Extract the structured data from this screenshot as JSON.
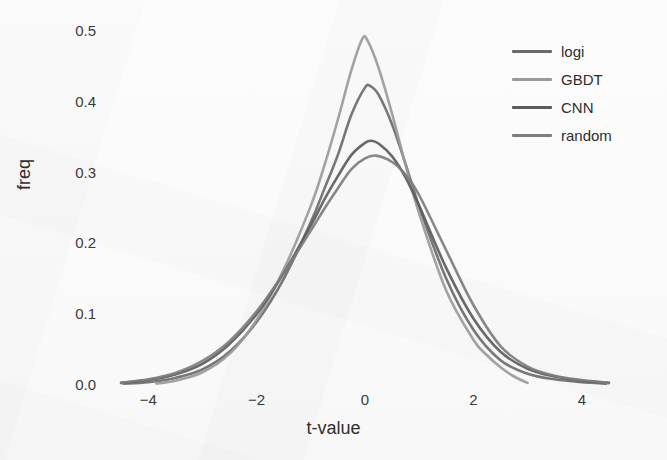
{
  "figure": {
    "background_color": "#fbfbfb",
    "axis_color": "#3a3a3a"
  },
  "chart_data": {
    "type": "line",
    "title": "",
    "subtitle": "",
    "xlabel": "t-value",
    "ylabel": "freq",
    "xlim": [
      -5.0,
      5.0
    ],
    "ylim": [
      0.0,
      0.52
    ],
    "xticks": [
      -4,
      -2,
      0,
      2,
      4
    ],
    "xtick_labels": [
      "−4",
      "−2",
      "0",
      "2",
      "4"
    ],
    "yticks": [
      0.0,
      0.1,
      0.2,
      0.3,
      0.4,
      0.5
    ],
    "ytick_labels": [
      "0.0",
      "0.1",
      "0.2",
      "0.3",
      "0.4",
      "0.5"
    ],
    "grid": false,
    "legend_position": "upper right",
    "legend_entries": [
      "logi",
      "GBDT",
      "CNN",
      "random"
    ],
    "series": [
      {
        "name": "logi",
        "color": "#6b6b6b",
        "peak_x": 0.02,
        "peak_y": 0.422,
        "x_start": -4.45,
        "x_end": 4.45,
        "points": [
          [
            -4.45,
            0.002
          ],
          [
            -4.0,
            0.004
          ],
          [
            -3.5,
            0.01
          ],
          [
            -3.0,
            0.022
          ],
          [
            -2.5,
            0.047
          ],
          [
            -2.0,
            0.089
          ],
          [
            -1.5,
            0.15
          ],
          [
            -1.0,
            0.23
          ],
          [
            -0.75,
            0.277
          ],
          [
            -0.5,
            0.325
          ],
          [
            -0.25,
            0.382
          ],
          [
            0.0,
            0.42
          ],
          [
            0.1,
            0.422
          ],
          [
            0.25,
            0.41
          ],
          [
            0.5,
            0.368
          ],
          [
            0.75,
            0.312
          ],
          [
            1.0,
            0.252
          ],
          [
            1.5,
            0.15
          ],
          [
            2.0,
            0.078
          ],
          [
            2.5,
            0.035
          ],
          [
            3.0,
            0.016
          ],
          [
            3.5,
            0.008
          ],
          [
            4.0,
            0.004
          ],
          [
            4.45,
            0.002
          ]
        ]
      },
      {
        "name": "GBDT",
        "color": "#9a9a9a",
        "peak_x": -0.05,
        "peak_y": 0.489,
        "x_start": -3.85,
        "x_end": 3.0,
        "points": [
          [
            -3.85,
            0.002
          ],
          [
            -3.5,
            0.006
          ],
          [
            -3.0,
            0.018
          ],
          [
            -2.5,
            0.044
          ],
          [
            -2.0,
            0.092
          ],
          [
            -1.5,
            0.163
          ],
          [
            -1.0,
            0.253
          ],
          [
            -0.75,
            0.31
          ],
          [
            -0.5,
            0.375
          ],
          [
            -0.25,
            0.445
          ],
          [
            -0.05,
            0.489
          ],
          [
            0.05,
            0.486
          ],
          [
            0.25,
            0.448
          ],
          [
            0.5,
            0.383
          ],
          [
            0.75,
            0.31
          ],
          [
            1.0,
            0.242
          ],
          [
            1.5,
            0.133
          ],
          [
            2.0,
            0.064
          ],
          [
            2.25,
            0.042
          ],
          [
            2.5,
            0.025
          ],
          [
            2.75,
            0.012
          ],
          [
            3.0,
            0.003
          ]
        ]
      },
      {
        "name": "CNN",
        "color": "#5c5c5c",
        "peak_x": 0.12,
        "peak_y": 0.345,
        "x_start": -4.5,
        "x_end": 4.5,
        "points": [
          [
            -4.5,
            0.003
          ],
          [
            -4.0,
            0.007
          ],
          [
            -3.5,
            0.015
          ],
          [
            -3.0,
            0.03
          ],
          [
            -2.5,
            0.058
          ],
          [
            -2.0,
            0.1
          ],
          [
            -1.5,
            0.158
          ],
          [
            -1.0,
            0.225
          ],
          [
            -0.75,
            0.262
          ],
          [
            -0.5,
            0.295
          ],
          [
            -0.25,
            0.325
          ],
          [
            0.0,
            0.342
          ],
          [
            0.12,
            0.345
          ],
          [
            0.25,
            0.341
          ],
          [
            0.5,
            0.323
          ],
          [
            0.75,
            0.293
          ],
          [
            1.0,
            0.253
          ],
          [
            1.5,
            0.165
          ],
          [
            2.0,
            0.094
          ],
          [
            2.5,
            0.047
          ],
          [
            3.0,
            0.023
          ],
          [
            3.5,
            0.012
          ],
          [
            4.0,
            0.006
          ],
          [
            4.5,
            0.003
          ]
        ]
      },
      {
        "name": "random",
        "color": "#7d7d7d",
        "peak_x": 0.2,
        "peak_y": 0.324,
        "x_start": -4.5,
        "x_end": 4.5,
        "points": [
          [
            -4.5,
            0.003
          ],
          [
            -4.0,
            0.008
          ],
          [
            -3.5,
            0.017
          ],
          [
            -3.0,
            0.034
          ],
          [
            -2.5,
            0.062
          ],
          [
            -2.0,
            0.104
          ],
          [
            -1.5,
            0.158
          ],
          [
            -1.0,
            0.218
          ],
          [
            -0.75,
            0.249
          ],
          [
            -0.5,
            0.278
          ],
          [
            -0.25,
            0.305
          ],
          [
            0.0,
            0.32
          ],
          [
            0.2,
            0.324
          ],
          [
            0.5,
            0.315
          ],
          [
            0.75,
            0.297
          ],
          [
            1.0,
            0.268
          ],
          [
            1.5,
            0.19
          ],
          [
            2.0,
            0.113
          ],
          [
            2.5,
            0.055
          ],
          [
            3.0,
            0.026
          ],
          [
            3.5,
            0.013
          ],
          [
            4.0,
            0.007
          ],
          [
            4.5,
            0.003
          ]
        ]
      }
    ]
  }
}
